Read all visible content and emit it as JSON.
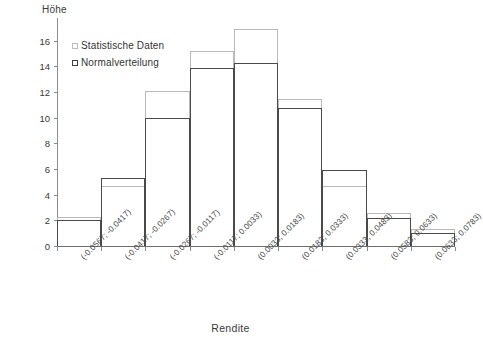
{
  "chart_data": {
    "type": "bar",
    "title": "",
    "subtitle": "",
    "xlabel": "Rendite",
    "ylabel": "Höhe",
    "grid": false,
    "legend_position": "top-left",
    "ylim": [
      0,
      17
    ],
    "yticks": [
      0,
      2,
      4,
      6,
      8,
      10,
      12,
      14,
      16
    ],
    "categories": [
      "(-0.0567; -0.0417)",
      "(-0.0417; -0.0267)",
      "(-0.0267; -0.0117)",
      "(-0.0117; 0.0033)",
      "(0.0033; 0.0183)",
      "(0.0183; 0.0333)",
      "(0.0333; 0.0483)",
      "(0.0583; 0.0633)",
      "(0.0633; 0.0783)"
    ],
    "series": [
      {
        "name": "Statistische Daten",
        "color": "#b9b9b9",
        "values": [
          2.3,
          4.7,
          12.1,
          15.2,
          16.9,
          11.5,
          4.7,
          2.6,
          1.3
        ]
      },
      {
        "name": "Normalverteilung",
        "color": "#4a4a4a",
        "values": [
          2.0,
          5.3,
          10.0,
          13.9,
          14.3,
          10.8,
          5.9,
          2.2,
          1.0
        ]
      }
    ]
  },
  "legend": {
    "items": [
      {
        "label": "Statistische Daten"
      },
      {
        "label": "Normalverteilung"
      }
    ]
  },
  "axes": {
    "y_title": "Höhe",
    "x_title": "Rendite"
  }
}
